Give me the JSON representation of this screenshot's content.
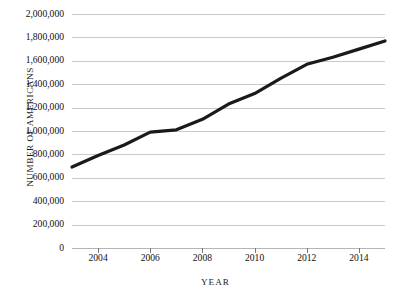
{
  "chart_data": {
    "type": "line",
    "title": "",
    "xlabel": "YEAR",
    "ylabel": "NUMBER OF AMERICANS",
    "xlim": [
      2003,
      2015
    ],
    "ylim": [
      0,
      2000000
    ],
    "grid": true,
    "legend": false,
    "line_color": "#1a1a1a",
    "gridline_color": "#c9c9c9",
    "x": [
      2003,
      2004,
      2005,
      2006,
      2007,
      2008,
      2009,
      2010,
      2011,
      2012,
      2013,
      2014,
      2015
    ],
    "values": [
      692000,
      790000,
      880000,
      990000,
      1010000,
      1100000,
      1230000,
      1320000,
      1450000,
      1570000,
      1630000,
      1700000,
      1770000
    ],
    "series": [
      {
        "name": "Number of Americans",
        "values": [
          692000,
          790000,
          880000,
          990000,
          1010000,
          1100000,
          1230000,
          1320000,
          1450000,
          1570000,
          1630000,
          1700000,
          1770000
        ]
      }
    ],
    "y_ticks": [
      0,
      200000,
      400000,
      600000,
      800000,
      1000000,
      1200000,
      1400000,
      1600000,
      1800000,
      2000000
    ],
    "y_tick_labels": [
      "0",
      "200,000",
      "400,000",
      "600,000",
      "800,000",
      "1,000,000",
      "1,200,000",
      "1,400,000",
      "1,600,000",
      "1,800,000",
      "2,000,000"
    ],
    "x_ticks": [
      2004,
      2006,
      2008,
      2010,
      2012,
      2014
    ],
    "x_tick_labels": [
      "2004",
      "2006",
      "2008",
      "2010",
      "2012",
      "2014"
    ]
  }
}
